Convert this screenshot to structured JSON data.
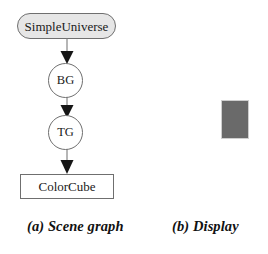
{
  "figure": {
    "background_color": "#ffffff",
    "panels": [
      {
        "id": "scene-graph",
        "caption": "(a) Scene graph"
      },
      {
        "id": "display",
        "caption": "(b) Display"
      }
    ]
  },
  "scene_graph": {
    "nodes": [
      {
        "id": "simpleuniverse",
        "label": "SimpleUniverse",
        "shape": "rounded-rectangle",
        "fill": "#e6e6e6",
        "stroke": "#6f6f6f"
      },
      {
        "id": "bg",
        "label": "BG",
        "shape": "circle",
        "fill": "#ffffff",
        "stroke": "#6f6f6f"
      },
      {
        "id": "tg",
        "label": "TG",
        "shape": "circle",
        "fill": "#ffffff",
        "stroke": "#6f6f6f"
      },
      {
        "id": "colorcube",
        "label": "ColorCube",
        "shape": "rectangle",
        "fill": "#ffffff",
        "stroke": "#6f6f6f"
      }
    ],
    "edges": [
      {
        "id": "edge-su-bg",
        "from": "SimpleUniverse",
        "to": "BG",
        "style": "solid-line-filled-arrowhead"
      },
      {
        "id": "edge-bg-tg",
        "from": "BG",
        "to": "TG",
        "style": "solid-line-filled-arrowhead"
      },
      {
        "id": "edge-tg-colorcube",
        "from": "TG",
        "to": "ColorCube",
        "style": "solid-line-filled-arrowhead"
      }
    ]
  },
  "display": {
    "object_name": "color-cube-render",
    "fill_color": "#6a6a6a",
    "border_color": "#cfcfcf"
  },
  "captions": {
    "a": "(a) Scene graph",
    "b": "(b) Display"
  }
}
